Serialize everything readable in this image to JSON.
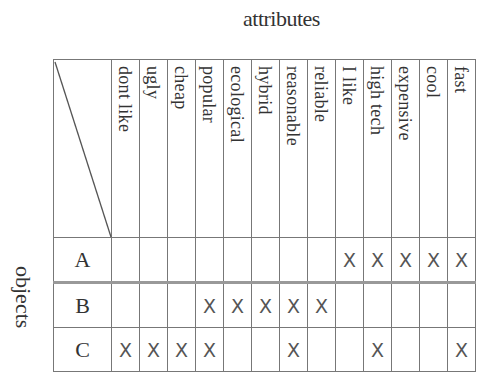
{
  "title": "attributes",
  "side_label": "objects",
  "attributes": [
    "dont like",
    "ugly",
    "cheap",
    "popular",
    "ecological",
    "hybrid",
    "reasonable",
    "reliable",
    "I like",
    "high tech",
    "expensive",
    "cool",
    "fast"
  ],
  "mark_symbol": "X",
  "rows": [
    {
      "object": "A",
      "cells": [
        "",
        "",
        "",
        "",
        "",
        "",
        "",
        "",
        "X",
        "X",
        "X",
        "X",
        "X"
      ]
    },
    {
      "object": "B",
      "cells": [
        "",
        "",
        "",
        "X",
        "X",
        "X",
        "X",
        "X",
        "",
        "",
        "",
        "",
        ""
      ]
    },
    {
      "object": "C",
      "cells": [
        "X",
        "X",
        "X",
        "X",
        "",
        "",
        "X",
        "",
        "",
        "X",
        "",
        "",
        "X"
      ]
    }
  ]
}
